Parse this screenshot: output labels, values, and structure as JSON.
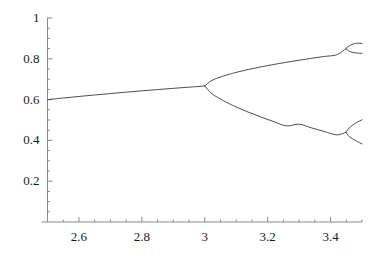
{
  "chart_data": {
    "type": "line",
    "title": "",
    "subtitle": "",
    "xlabel": "",
    "ylabel": "",
    "xlim": [
      2.5,
      3.5
    ],
    "ylim": [
      0,
      1
    ],
    "grid": false,
    "legend": null,
    "x_ticks": [
      {
        "value": 2.6,
        "label": "2.6"
      },
      {
        "value": 2.8,
        "label": "2.8"
      },
      {
        "value": 3.0,
        "label": "3"
      },
      {
        "value": 3.2,
        "label": "3.2"
      },
      {
        "value": 3.4,
        "label": "3.4"
      }
    ],
    "x_minor_ticks": [
      2.55,
      2.65,
      2.7,
      2.75,
      2.85,
      2.9,
      2.95,
      3.05,
      3.1,
      3.15,
      3.25,
      3.3,
      3.35,
      3.45,
      3.5
    ],
    "y_ticks": [
      {
        "value": 0.2,
        "label": "0.2"
      },
      {
        "value": 0.4,
        "label": "0.4"
      },
      {
        "value": 0.6,
        "label": "0.6"
      },
      {
        "value": 0.8,
        "label": "0.8"
      },
      {
        "value": 1.0,
        "label": "1"
      }
    ],
    "y_minor_ticks": [
      0.05,
      0.1,
      0.15,
      0.25,
      0.3,
      0.35,
      0.45,
      0.5,
      0.55,
      0.65,
      0.7,
      0.75,
      0.85,
      0.9,
      0.95
    ],
    "line_color": "#3a3a3a",
    "axis_color": "#8a8a8a",
    "bifurcation_points": [
      {
        "r": 3.0,
        "x": 0.6667,
        "order": 2
      },
      {
        "r": 3.449,
        "x": 0.8499,
        "order": 4
      },
      {
        "r": 3.449,
        "x": 0.44,
        "order": 4
      }
    ],
    "series": [
      {
        "name": "fixed-point-branch",
        "points": [
          [
            2.5,
            0.6
          ],
          [
            2.55,
            0.6078
          ],
          [
            2.6,
            0.6154
          ],
          [
            2.65,
            0.6226
          ],
          [
            2.7,
            0.6296
          ],
          [
            2.75,
            0.6364
          ],
          [
            2.8,
            0.6429
          ],
          [
            2.85,
            0.6491
          ],
          [
            2.9,
            0.6552
          ],
          [
            2.95,
            0.661
          ],
          [
            3.0,
            0.6667
          ]
        ]
      },
      {
        "name": "period-2-upper-branch",
        "points": [
          [
            3.0,
            0.6667
          ],
          [
            3.02,
            0.6918
          ],
          [
            3.04,
            0.7053
          ],
          [
            3.06,
            0.716
          ],
          [
            3.08,
            0.7252
          ],
          [
            3.1,
            0.7335
          ],
          [
            3.14,
            0.748
          ],
          [
            3.18,
            0.7608
          ],
          [
            3.22,
            0.7724
          ],
          [
            3.26,
            0.7831
          ],
          [
            3.3,
            0.7931
          ],
          [
            3.34,
            0.8025
          ],
          [
            3.38,
            0.8115
          ],
          [
            3.42,
            0.82
          ],
          [
            3.449,
            0.8499
          ]
        ]
      },
      {
        "name": "period-2-lower-branch",
        "points": [
          [
            3.0,
            0.6667
          ],
          [
            3.02,
            0.6321
          ],
          [
            3.04,
            0.6115
          ],
          [
            3.06,
            0.594
          ],
          [
            3.08,
            0.5783
          ],
          [
            3.1,
            0.5639
          ],
          [
            3.14,
            0.5376
          ],
          [
            3.18,
            0.5138
          ],
          [
            3.22,
            0.4918
          ],
          [
            3.26,
            0.4712
          ],
          [
            3.3,
            0.4794
          ],
          [
            3.34,
            0.4611
          ],
          [
            3.38,
            0.4437
          ],
          [
            3.42,
            0.4271
          ],
          [
            3.449,
            0.44
          ]
        ]
      },
      {
        "name": "period-4-branch-1",
        "points": [
          [
            3.449,
            0.8499
          ],
          [
            3.46,
            0.864
          ],
          [
            3.48,
            0.876
          ],
          [
            3.5,
            0.875
          ]
        ]
      },
      {
        "name": "period-4-branch-2",
        "points": [
          [
            3.449,
            0.8499
          ],
          [
            3.46,
            0.836
          ],
          [
            3.48,
            0.829
          ],
          [
            3.5,
            0.827
          ]
        ]
      },
      {
        "name": "period-4-branch-3",
        "points": [
          [
            3.449,
            0.44
          ],
          [
            3.46,
            0.462
          ],
          [
            3.48,
            0.485
          ],
          [
            3.5,
            0.501
          ]
        ]
      },
      {
        "name": "period-4-branch-4",
        "points": [
          [
            3.449,
            0.44
          ],
          [
            3.46,
            0.418
          ],
          [
            3.48,
            0.399
          ],
          [
            3.5,
            0.383
          ]
        ]
      }
    ]
  }
}
